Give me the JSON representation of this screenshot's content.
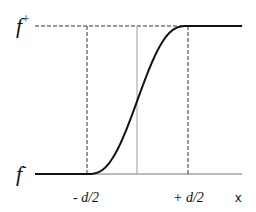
{
  "diagram": {
    "type": "sigmoid-step-profile",
    "labels": {
      "upper_level": "f",
      "upper_sup": "+",
      "lower_level": "f",
      "lower_sup": "-",
      "left_mark": "- d/2",
      "right_mark": "+ d/2",
      "axis": "x"
    },
    "colors": {
      "curve": "#111111",
      "dashed": "#333333",
      "center_line": "#9a9a9a",
      "baseline": "#777777"
    },
    "curve": {
      "description": "smooth S-shaped transition from f- to f+ centered at x=0, spanning -d/2 to +d/2",
      "x_domain": [
        -1.0,
        1.0
      ],
      "transition_half_width": 0.5
    }
  }
}
